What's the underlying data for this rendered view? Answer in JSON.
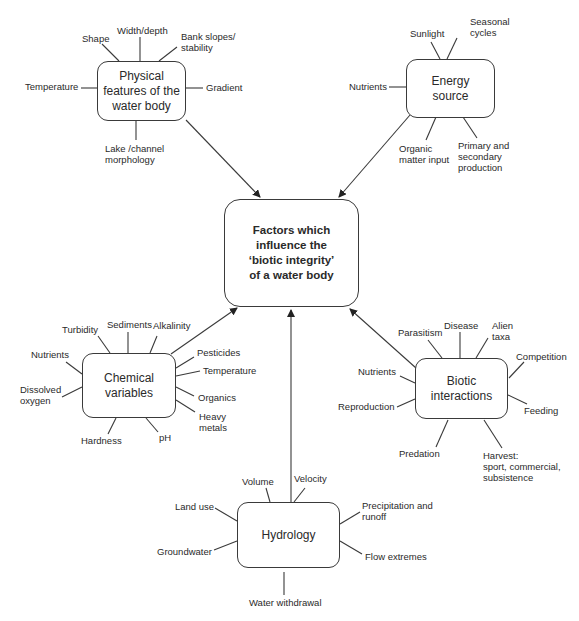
{
  "center": {
    "title": "Factors which\ninfluence the\n‘biotic integrity’\nof a water body"
  },
  "nodes": {
    "physical": {
      "title": "Physical\nfeatures of the\nwater body",
      "factors": [
        "Shape",
        "Width/depth",
        "Bank slopes/\nstability",
        "Temperature",
        "Gradient",
        "Lake /channel\nmorphology"
      ]
    },
    "energy": {
      "title": "Energy\nsource",
      "factors": [
        "Sunlight",
        "Seasonal\ncycles",
        "Nutrients",
        "Organic\nmatter input",
        "Primary and\nsecondary\nproduction"
      ]
    },
    "chemical": {
      "title": "Chemical\nvariables",
      "factors": [
        "Turbidity",
        "Sediments",
        "Alkalinity",
        "Nutrients",
        "Dissolved\noxygen",
        "Hardness",
        "pH",
        "Pesticides",
        "Temperature",
        "Organics",
        "Heavy\nmetals"
      ]
    },
    "biotic": {
      "title": "Biotic\ninteractions",
      "factors": [
        "Parasitism",
        "Disease",
        "Alien\ntaxa",
        "Competition",
        "Nutrients",
        "Reproduction",
        "Feeding",
        "Predation",
        "Harvest:\nsport, commercial,\nsubsistence"
      ]
    },
    "hydrology": {
      "title": "Hydrology",
      "factors": [
        "Volume",
        "Velocity",
        "Land use",
        "Precipitation and\nrunoff",
        "Groundwater",
        "Flow extremes",
        "Water withdrawal"
      ]
    }
  },
  "colors": {
    "line": "#3a3a3a",
    "text": "#2a2a2a",
    "background": "#ffffff"
  }
}
